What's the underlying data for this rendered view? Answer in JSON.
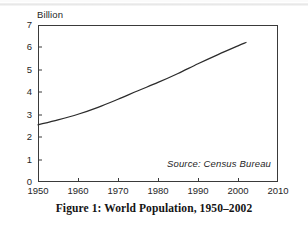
{
  "figure": {
    "caption": "Figure 1: World Population, 1950–2002",
    "source_note": "Source: Census Bureau"
  },
  "chart_data": {
    "type": "line",
    "title": "",
    "subtitle": "",
    "xlabel": "",
    "ylabel": "Billion",
    "xlim": [
      1950,
      2010
    ],
    "ylim": [
      0,
      7
    ],
    "grid": false,
    "legend": "none",
    "annotations": [
      {
        "text": "Source: Census Bureau",
        "x": 1994,
        "y": 0.55,
        "style": "italic"
      }
    ],
    "xticks": [
      1950,
      1960,
      1970,
      1980,
      1990,
      2000,
      2010
    ],
    "xtick_labels": [
      "1950",
      "1960",
      "1970",
      "1980",
      "1990",
      "2000",
      "2010"
    ],
    "yticks": [
      0,
      1,
      2,
      3,
      4,
      5,
      6,
      7
    ],
    "ytick_labels": [
      "0",
      "1",
      "2",
      "3",
      "4",
      "5",
      "6",
      "7"
    ],
    "series": [
      {
        "name": "World Population",
        "color": "#2b2b2b",
        "x": [
          1950,
          1955,
          1960,
          1965,
          1970,
          1975,
          1980,
          1985,
          1990,
          1995,
          2000,
          2002
        ],
        "values": [
          2.55,
          2.77,
          3.02,
          3.33,
          3.69,
          4.07,
          4.44,
          4.84,
          5.27,
          5.68,
          6.07,
          6.22
        ]
      }
    ]
  }
}
